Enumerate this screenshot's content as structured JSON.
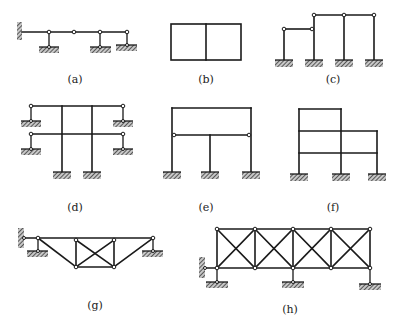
{
  "figure": {
    "panels": [
      {
        "id": "a",
        "label": "(a)",
        "description": "Multi-span hinged beam with fixed wall at left and three link supports"
      },
      {
        "id": "b",
        "label": "(b)",
        "description": "Closed two-bay rectangular frame"
      },
      {
        "id": "c",
        "label": "(c)",
        "description": "Stepped bent frame with hinged beams on four fixed columns"
      },
      {
        "id": "d",
        "label": "(d)",
        "description": "Two-story frame on two fixed columns with hinged outrigger links"
      },
      {
        "id": "e",
        "label": "(e)",
        "description": "Portal frame with hinged intermediate beam and centre column"
      },
      {
        "id": "f",
        "label": "(f)",
        "description": "Rigid multi-story frame with stepped roof"
      },
      {
        "id": "g",
        "label": "(g)",
        "description": "Trapezoidal truss with X-braced centre panel"
      },
      {
        "id": "h",
        "label": "(h)",
        "description": "Four-panel X-braced truss on three supports with wall link"
      }
    ]
  },
  "colors": {
    "line": "#1a1a1a",
    "hatch": "#555555",
    "background": "#ffffff"
  }
}
